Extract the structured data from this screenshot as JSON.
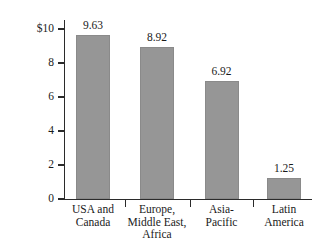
{
  "chart_data": {
    "type": "bar",
    "title": "",
    "xlabel": "",
    "ylabel": "Revenue in $billion",
    "categories": [
      "USA and Canada",
      "Europe, Middle East, Africa",
      "Asia-Pacific",
      "Latin America"
    ],
    "category_lines": [
      [
        "USA and",
        "Canada"
      ],
      [
        "Europe,",
        "Middle East,",
        "Africa"
      ],
      [
        "Asia-",
        "Pacific"
      ],
      [
        "Latin",
        "America"
      ]
    ],
    "values": [
      9.63,
      8.92,
      6.92,
      1.25
    ],
    "value_labels": [
      "9.63",
      "8.92",
      "6.92",
      "1.25"
    ],
    "ylim": [
      0,
      10
    ],
    "yticks": [
      10,
      8,
      6,
      4,
      2,
      0
    ],
    "ytick_labels": [
      "$10",
      "8",
      "6",
      "4",
      "2",
      "0"
    ],
    "grid": false,
    "legend": false,
    "bar_color": "#969696",
    "axis_color": "#2b2b2b",
    "text_color": "#1a1a1a"
  }
}
